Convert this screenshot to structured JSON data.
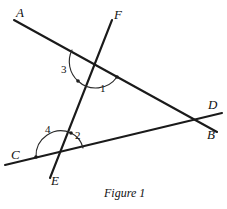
{
  "figure": {
    "caption": "Figure 1",
    "caption_pos": {
      "x": 104,
      "y": 186
    },
    "canvas": {
      "width": 227,
      "height": 209
    },
    "stroke_color": "#1a1a1a",
    "arc_color": "#2a2a2a",
    "background": "#ffffff"
  },
  "lines": [
    {
      "id": "line-ab",
      "name": "line-ab",
      "from_label": "A",
      "to_label": "B",
      "x1": 14,
      "y1": 20,
      "x2": 217,
      "y2": 132
    },
    {
      "id": "line-cd",
      "name": "line-cd",
      "from_label": "C",
      "to_label": "D",
      "x1": 5,
      "y1": 165,
      "x2": 222,
      "y2": 113
    },
    {
      "id": "line-ef",
      "name": "line-ef",
      "from_label": "F",
      "to_label": "E",
      "x1": 112,
      "y1": 20,
      "x2": 50,
      "y2": 178
    }
  ],
  "point_labels": [
    {
      "text": "A",
      "x": 16,
      "y": 6,
      "name": "point-label-a"
    },
    {
      "text": "F",
      "x": 114,
      "y": 8,
      "name": "point-label-f"
    },
    {
      "text": "D",
      "x": 208,
      "y": 98,
      "name": "point-label-d"
    },
    {
      "text": "B",
      "x": 207,
      "y": 128,
      "name": "point-label-b"
    },
    {
      "text": "C",
      "x": 11,
      "y": 148,
      "name": "point-label-c"
    },
    {
      "text": "E",
      "x": 51,
      "y": 174,
      "name": "point-label-e"
    }
  ],
  "angle_labels": [
    {
      "text": "1",
      "x": 100,
      "y": 83,
      "name": "angle-label-1"
    },
    {
      "text": "2",
      "x": 75,
      "y": 130,
      "name": "angle-label-2"
    },
    {
      "text": "3",
      "x": 61,
      "y": 64,
      "name": "angle-label-3"
    },
    {
      "text": "4",
      "x": 45,
      "y": 124,
      "name": "angle-label-4"
    }
  ],
  "intersections": [
    {
      "name": "intersection-ab-ef",
      "x": 95,
      "y": 64,
      "lines": [
        "line-ab",
        "line-ef"
      ]
    },
    {
      "name": "intersection-cd-ef",
      "x": 60,
      "y": 155,
      "lines": [
        "line-cd",
        "line-ef"
      ]
    },
    {
      "name": "intersection-ab-cd",
      "x": 196,
      "y": 121,
      "lines": [
        "line-ab",
        "line-cd"
      ]
    }
  ],
  "angle_arcs": [
    {
      "name": "angle-arc-3",
      "label": "3",
      "path": "M 72 50 A 26 26 0 0 0 78 81",
      "tick": {
        "x": 78,
        "y": 81
      }
    },
    {
      "name": "angle-arc-1",
      "label": "1",
      "path": "M 78 81 A 26 26 0 0 0 117 77",
      "tick": {
        "x": 117,
        "y": 77
      }
    },
    {
      "name": "angle-arc-4",
      "label": "4",
      "path": "M 36 157 A 25 25 0 0 1 71 133",
      "tick": {
        "x": 36,
        "y": 157
      }
    },
    {
      "name": "angle-arc-2",
      "label": "2",
      "path": "M 71 133 A 22 22 0 0 1 83 148",
      "tick": {
        "x": 71,
        "y": 133
      }
    }
  ],
  "chart_data": {
    "type": "diagram",
    "title": "Figure 1",
    "elements": {
      "lines": [
        "AB",
        "CD",
        "EF"
      ],
      "numbered_angles": [
        "1",
        "2",
        "3",
        "4"
      ],
      "endpoint_labels": [
        "A",
        "B",
        "C",
        "D",
        "E",
        "F"
      ]
    }
  }
}
